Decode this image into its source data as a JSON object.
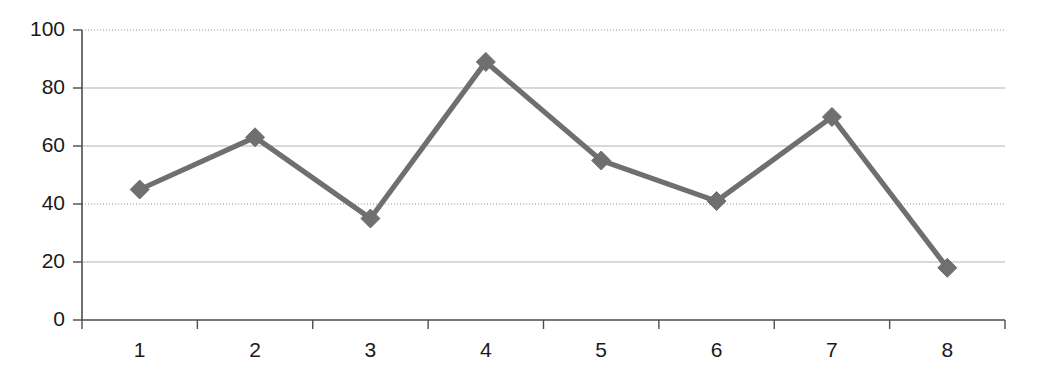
{
  "chart_data": {
    "type": "line",
    "title": "",
    "xlabel": "",
    "ylabel": "",
    "categories": [
      "1",
      "2",
      "3",
      "4",
      "5",
      "6",
      "7",
      "8"
    ],
    "values": [
      45,
      63,
      35,
      89,
      55,
      41,
      70,
      18
    ],
    "series": [
      {
        "name": "Series 1",
        "values": [
          45,
          63,
          35,
          89,
          55,
          41,
          70,
          18
        ]
      }
    ],
    "ylim": [
      0,
      100
    ],
    "ytick_labels": [
      "0",
      "20",
      "40",
      "60",
      "80",
      "100"
    ],
    "ytick_values": [
      0,
      20,
      40,
      60,
      80,
      100
    ],
    "xtick_labels": [
      "1",
      "2",
      "3",
      "4",
      "5",
      "6",
      "7",
      "8"
    ],
    "grid": true,
    "gridline_styles": {
      "0": "none",
      "20": "solid",
      "40": "dotted",
      "60": "solid",
      "80": "solid",
      "100": "dotted"
    },
    "legend": "none",
    "marker": "diamond",
    "colors": {
      "series": "#6f6f6f",
      "marker": "#6f6f6f",
      "axis": "#4d4d4d",
      "gridline_solid": "#b4b4b4",
      "gridline_dotted": "#9a9a9a",
      "tick_text": "#1a1a1a",
      "background": "#ffffff"
    }
  }
}
